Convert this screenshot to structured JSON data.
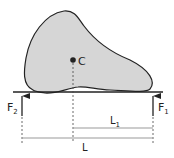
{
  "diagram": {
    "colors": {
      "body_fill": "#d6d6d6",
      "stroke": "#222222",
      "dim_line": "#999999"
    },
    "labels": {
      "center": "C",
      "force_left": "F",
      "force_left_sub": "2",
      "force_right": "F",
      "force_right_sub": "1",
      "dist_partial": "L",
      "dist_partial_sub": "1",
      "dist_total": "L"
    }
  }
}
